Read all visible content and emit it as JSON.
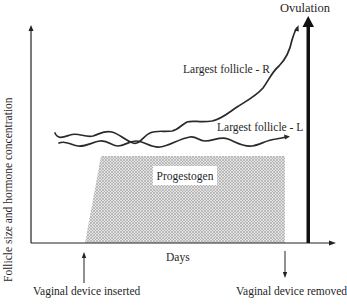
{
  "diagram": {
    "y_axis_label": "Follicle size and hormone concentration",
    "x_axis_label": "Days",
    "ovulation_label": "Ovulation",
    "curves": [
      {
        "name": "largest-follicle-r",
        "label": "Largest follicle - R",
        "trend": "wavy baseline then rises sharply toward ovulation"
      },
      {
        "name": "largest-follicle-l",
        "label": "Largest follicle - L",
        "trend": "wavy, roughly flat until device removal"
      }
    ],
    "shaded_region": {
      "label": "Progestogen",
      "start_event": "Vaginal device inserted",
      "end_event": "Vaginal device removed"
    },
    "events": {
      "inserted": "Vaginal device inserted",
      "removed": "Vaginal device removed"
    },
    "colors": {
      "line": "#222222",
      "shading": "#bdbdbd",
      "background": "#ffffff"
    }
  }
}
